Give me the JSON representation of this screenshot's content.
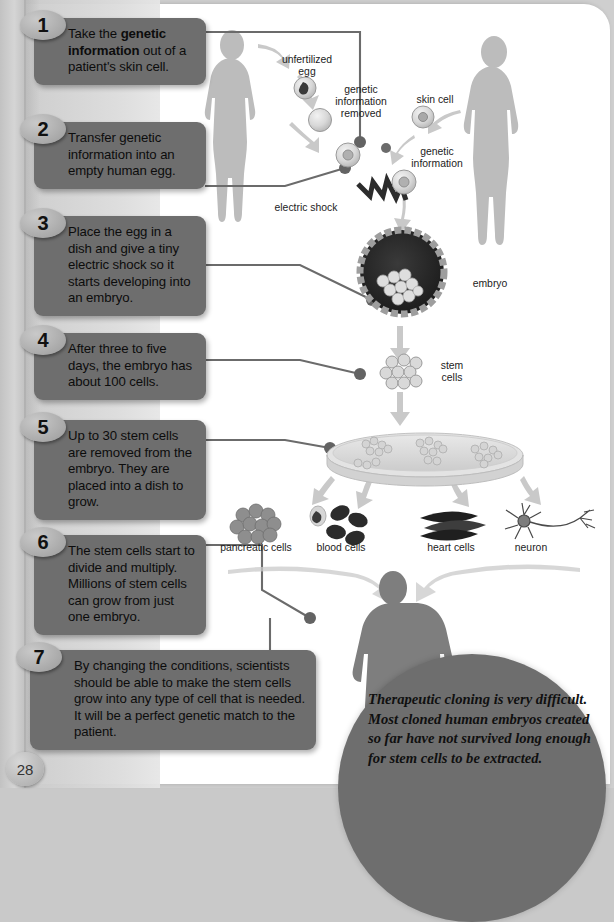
{
  "page": {
    "number": "28",
    "background_color": "#cfcfcf",
    "sheet_color": "#ffffff",
    "box_color": "#6e6e6e",
    "badge_color": "#b4b4b4"
  },
  "steps": [
    {
      "number": "1",
      "text_html": "Take the <b>genetic information</b> out of a patient's skin cell."
    },
    {
      "number": "2",
      "text_html": "Transfer genetic information into an empty human egg."
    },
    {
      "number": "3",
      "text_html": "Place the egg in a dish and give a tiny electric shock so it starts developing into an embryo."
    },
    {
      "number": "4",
      "text_html": "After three to five days, the embryo has about 100 cells."
    },
    {
      "number": "5",
      "text_html": "Up to 30 stem cells are removed from the embryo. They are placed into a dish to grow."
    },
    {
      "number": "6",
      "text_html": "The stem cells start to divide and multiply. Millions of stem cells can grow from just one embryo."
    },
    {
      "number": "7",
      "text_html": "By changing the conditions, scientists should be able to make the stem cells grow into any type of cell that is needed. It will be a perfect genetic match to the patient."
    }
  ],
  "note": {
    "text": "Therapeutic cloning is very difficult. Most cloned human embryos created so far have not survived long enough for stem cells to be extracted."
  },
  "diagram_labels": {
    "unfertilized_egg": "unfertilized\negg",
    "unfertilized_egg_line1": "unfertilized",
    "unfertilized_egg_line2": "egg",
    "genetic_information_removed_1": "genetic",
    "genetic_information_removed_2": "information",
    "genetic_information_removed_3": "removed",
    "skin_cell": "skin cell",
    "genetic_information_1": "genetic",
    "genetic_information_2": "information",
    "electric_shock": "electric shock",
    "embryo": "embryo",
    "stem_cells_1": "stem",
    "stem_cells_2": "cells",
    "pancreatic_cells": "pancreatic cells",
    "blood_cells": "blood cells",
    "heart_cells": "heart cells",
    "neuron": "neuron"
  }
}
